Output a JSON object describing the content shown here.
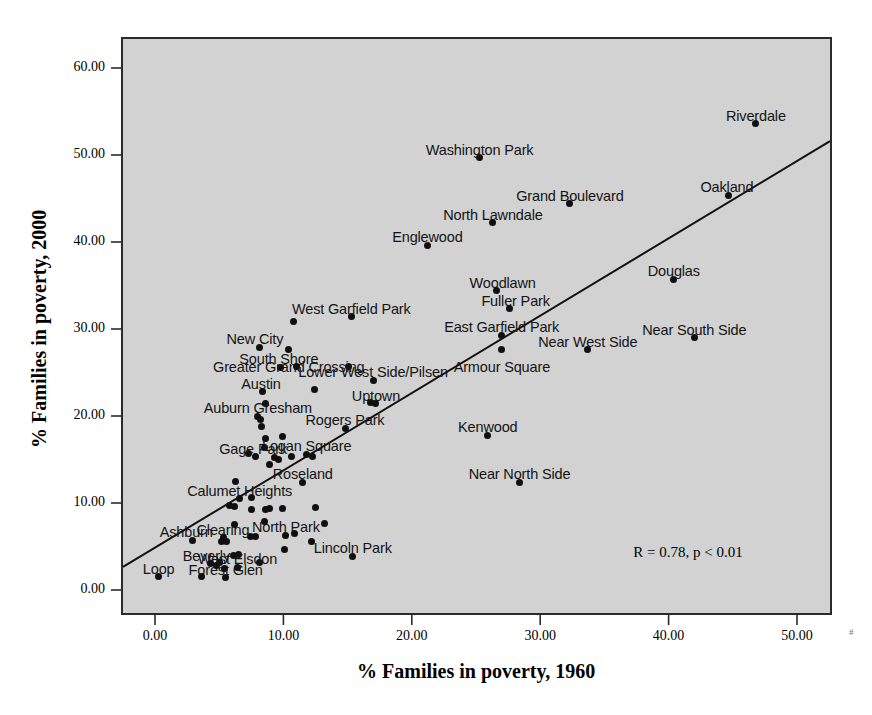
{
  "chart_data": {
    "type": "scatter",
    "title": "",
    "xlabel": "% Families in poverty, 1960",
    "ylabel": "% Families in poverty, 2000",
    "xlim": [
      -3.5,
      54.5
    ],
    "ylim": [
      -4.5,
      64.5
    ],
    "xticks": [
      "0.00",
      "10.00",
      "20.00",
      "30.00",
      "40.00",
      "50.00"
    ],
    "xtick_values": [
      0,
      10,
      20,
      30,
      40,
      50
    ],
    "yticks": [
      "0.00",
      "10.00",
      "20.00",
      "30.00",
      "40.00",
      "50.00",
      "60.00"
    ],
    "ytick_values": [
      0,
      10,
      20,
      30,
      40,
      50,
      60
    ],
    "grid": false,
    "legend": "none",
    "annotation": "R = 0.78, p < 0.01",
    "annotation_x": 41.5,
    "annotation_y": 4.2,
    "fit_line": {
      "type": "linear",
      "x_start": -3.0,
      "y_start": 2.2,
      "x_end": 54.5,
      "y_end": 53.3
    },
    "point_color": "#101010",
    "plot_background": "#d2d2d2",
    "axis_color": "#2b2b2b",
    "points": [
      {
        "label": "Riverdale",
        "x": 46.8,
        "y": 53.6,
        "lx": 0,
        "ly": -16
      },
      {
        "label": "Washington Park",
        "x": 25.3,
        "y": 49.7,
        "lx": 0,
        "ly": -16
      },
      {
        "label": "Oakland",
        "x": 44.7,
        "y": 45.4,
        "lx": -2,
        "ly": -16
      },
      {
        "label": "Grand Boulevard",
        "x": 32.3,
        "y": 44.4,
        "lx": 0,
        "ly": -16
      },
      {
        "label": "North Lawndale",
        "x": 26.3,
        "y": 42.2,
        "lx": 0,
        "ly": -16
      },
      {
        "label": "Englewood",
        "x": 21.2,
        "y": 39.6,
        "lx": 0,
        "ly": -16
      },
      {
        "label": "Douglas",
        "x": 40.4,
        "y": 35.7,
        "lx": 0,
        "ly": -16
      },
      {
        "label": "Woodlawn",
        "x": 26.6,
        "y": 34.4,
        "lx": 6,
        "ly": -16
      },
      {
        "label": "Fuller Park",
        "x": 27.6,
        "y": 32.3,
        "lx": 6,
        "ly": -16
      },
      {
        "label": "West Garfield Park",
        "x": 15.3,
        "y": 31.4,
        "lx": 0,
        "ly": -16
      },
      {
        "label": "East Garfield Park",
        "x": 27.0,
        "y": 29.3,
        "lx": 0,
        "ly": -16
      },
      {
        "label": "Near South Side",
        "x": 42.0,
        "y": 29.0,
        "lx": 0,
        "ly": -16
      },
      {
        "label": "New City",
        "x": 8.1,
        "y": 27.9,
        "lx": -4,
        "ly": -16
      },
      {
        "label": "Armour Square",
        "x": 27.0,
        "y": 27.6,
        "lx": 0,
        "ly": 9
      },
      {
        "label": "Near West Side",
        "x": 33.7,
        "y": 27.6,
        "lx": 0,
        "ly": -16
      },
      {
        "label": "Greater Grand Crossing",
        "x": 10.4,
        "y": 27.6,
        "lx": 0,
        "ly": 9
      },
      {
        "label": "South Shore",
        "x": 9.8,
        "y": 25.6,
        "lx": -2,
        "ly": -16
      },
      {
        "label": "Lower West Side/Pilsen",
        "x": 17.0,
        "y": 24.1,
        "lx": 0,
        "ly": -16
      },
      {
        "label": "Austin",
        "x": 8.4,
        "y": 22.8,
        "lx": -2,
        "ly": -16
      },
      {
        "label": "Uptown",
        "x": 17.2,
        "y": 21.4,
        "lx": 0,
        "ly": -16
      },
      {
        "label": "Auburn Gresham",
        "x": 8.0,
        "y": 20.0,
        "lx": 0,
        "ly": -16
      },
      {
        "label": "Kenwood",
        "x": 25.9,
        "y": 17.8,
        "lx": 0,
        "ly": -16
      },
      {
        "label": "Rogers Park",
        "x": 14.8,
        "y": 18.6,
        "lx": 0,
        "ly": -16
      },
      {
        "label": "Logan Square",
        "x": 11.8,
        "y": 15.6,
        "lx": 0,
        "ly": -16
      },
      {
        "label": "Gage Park",
        "x": 7.8,
        "y": 15.3,
        "lx": -2,
        "ly": -16
      },
      {
        "label": "Roseland",
        "x": 11.5,
        "y": 12.4,
        "lx": 0,
        "ly": -16
      },
      {
        "label": "Near North Side",
        "x": 28.4,
        "y": 12.4,
        "lx": 0,
        "ly": -16
      },
      {
        "label": "Calumet Heights",
        "x": 6.6,
        "y": 10.5,
        "lx": 0,
        "ly": -16
      },
      {
        "label": "North Park",
        "x": 10.2,
        "y": 6.3,
        "lx": 0,
        "ly": -16
      },
      {
        "label": "Clearing",
        "x": 5.3,
        "y": 6.0,
        "lx": 0,
        "ly": -16
      },
      {
        "label": "Ashburn",
        "x": 2.9,
        "y": 5.7,
        "lx": -6,
        "ly": -16
      },
      {
        "label": "Beverly",
        "x": 4.3,
        "y": 3.0,
        "lx": -4,
        "ly": -16
      },
      {
        "label": "West Elsdon",
        "x": 6.4,
        "y": 2.6,
        "lx": 0,
        "ly": -16
      },
      {
        "label": "Lincoln Park",
        "x": 15.4,
        "y": 3.9,
        "lx": 0,
        "ly": -16
      },
      {
        "label": "Forest Glen",
        "x": 5.5,
        "y": 1.4,
        "lx": 0,
        "ly": -16
      },
      {
        "label": "Loop",
        "x": 0.3,
        "y": 1.5,
        "lx": 0,
        "ly": -16
      },
      {
        "label": "",
        "x": 10.8,
        "y": 30.9,
        "lx": 0,
        "ly": 0
      },
      {
        "label": "",
        "x": 11.0,
        "y": 25.7,
        "lx": 0,
        "ly": 0
      },
      {
        "label": "",
        "x": 15.1,
        "y": 25.7,
        "lx": 0,
        "ly": 0
      },
      {
        "label": "",
        "x": 12.4,
        "y": 23.1,
        "lx": 0,
        "ly": 0
      },
      {
        "label": "",
        "x": 8.6,
        "y": 21.4,
        "lx": 0,
        "ly": 0
      },
      {
        "label": "",
        "x": 8.2,
        "y": 19.6,
        "lx": 0,
        "ly": 0
      },
      {
        "label": "",
        "x": 8.3,
        "y": 18.8,
        "lx": 0,
        "ly": 0
      },
      {
        "label": "",
        "x": 8.6,
        "y": 17.4,
        "lx": 0,
        "ly": 0
      },
      {
        "label": "",
        "x": 9.9,
        "y": 17.6,
        "lx": 0,
        "ly": 0
      },
      {
        "label": "",
        "x": 16.8,
        "y": 21.5,
        "lx": 0,
        "ly": 0
      },
      {
        "label": "",
        "x": 8.5,
        "y": 16.4,
        "lx": 0,
        "ly": 0
      },
      {
        "label": "",
        "x": 7.3,
        "y": 15.7,
        "lx": 0,
        "ly": 0
      },
      {
        "label": "",
        "x": 9.3,
        "y": 15.2,
        "lx": 0,
        "ly": 0
      },
      {
        "label": "",
        "x": 9.6,
        "y": 15.0,
        "lx": 0,
        "ly": 0
      },
      {
        "label": "",
        "x": 10.6,
        "y": 15.4,
        "lx": 0,
        "ly": 0
      },
      {
        "label": "",
        "x": 12.3,
        "y": 15.3,
        "lx": 0,
        "ly": 0
      },
      {
        "label": "",
        "x": 8.9,
        "y": 14.4,
        "lx": 0,
        "ly": 0
      },
      {
        "label": "",
        "x": 6.3,
        "y": 12.5,
        "lx": 0,
        "ly": 0
      },
      {
        "label": "",
        "x": 7.5,
        "y": 10.6,
        "lx": 0,
        "ly": 0
      },
      {
        "label": "",
        "x": 5.8,
        "y": 9.7,
        "lx": 0,
        "ly": 0
      },
      {
        "label": "",
        "x": 6.2,
        "y": 9.6,
        "lx": 0,
        "ly": 0
      },
      {
        "label": "",
        "x": 7.5,
        "y": 9.2,
        "lx": 0,
        "ly": 0
      },
      {
        "label": "",
        "x": 8.6,
        "y": 9.2,
        "lx": 0,
        "ly": 0
      },
      {
        "label": "",
        "x": 8.9,
        "y": 9.4,
        "lx": 0,
        "ly": 0
      },
      {
        "label": "",
        "x": 12.5,
        "y": 9.5,
        "lx": 0,
        "ly": 0
      },
      {
        "label": "",
        "x": 8.5,
        "y": 7.9,
        "lx": 0,
        "ly": 0
      },
      {
        "label": "",
        "x": 13.2,
        "y": 7.7,
        "lx": 0,
        "ly": 0
      },
      {
        "label": "",
        "x": 6.2,
        "y": 7.5,
        "lx": 0,
        "ly": 0
      },
      {
        "label": "",
        "x": 5.2,
        "y": 5.6,
        "lx": 0,
        "ly": 0
      },
      {
        "label": "",
        "x": 5.6,
        "y": 5.6,
        "lx": 0,
        "ly": 0
      },
      {
        "label": "",
        "x": 7.4,
        "y": 6.1,
        "lx": 0,
        "ly": 0
      },
      {
        "label": "",
        "x": 7.8,
        "y": 6.1,
        "lx": 0,
        "ly": 0
      },
      {
        "label": "",
        "x": 10.9,
        "y": 6.5,
        "lx": 0,
        "ly": 0
      },
      {
        "label": "",
        "x": 12.2,
        "y": 5.6,
        "lx": 0,
        "ly": 0
      },
      {
        "label": "",
        "x": 6.1,
        "y": 4.0,
        "lx": 0,
        "ly": 0
      },
      {
        "label": "",
        "x": 6.5,
        "y": 4.1,
        "lx": 0,
        "ly": 0
      },
      {
        "label": "",
        "x": 5.0,
        "y": 3.2,
        "lx": 0,
        "ly": 0
      },
      {
        "label": "",
        "x": 4.8,
        "y": 2.8,
        "lx": 0,
        "ly": 0
      },
      {
        "label": "",
        "x": 5.4,
        "y": 2.5,
        "lx": 0,
        "ly": 0
      },
      {
        "label": "",
        "x": 8.1,
        "y": 3.2,
        "lx": 0,
        "ly": 0
      },
      {
        "label": "",
        "x": 3.6,
        "y": 1.6,
        "lx": 0,
        "ly": 0
      },
      {
        "label": "",
        "x": 10.1,
        "y": 4.6,
        "lx": 0,
        "ly": 0
      },
      {
        "label": "",
        "x": 9.9,
        "y": 9.4,
        "lx": 0,
        "ly": 0
      }
    ]
  },
  "corner_mark": "#"
}
